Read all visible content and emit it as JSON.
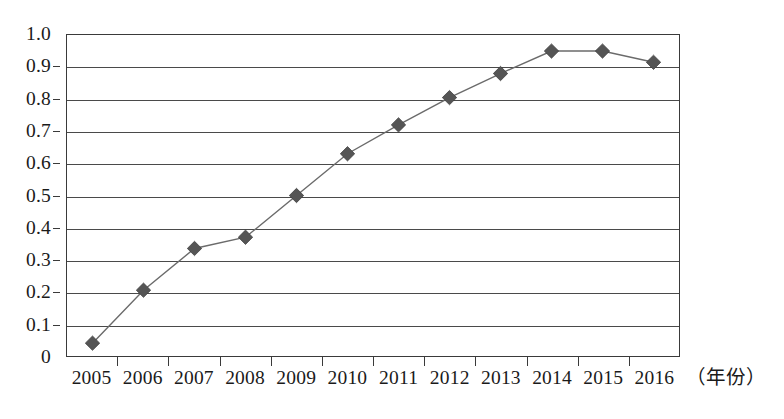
{
  "chart_data": {
    "type": "line",
    "title": "",
    "subtitle": "",
    "xlabel": "（年份）",
    "ylabel": "",
    "categories": [
      "2005",
      "2006",
      "2007",
      "2008",
      "2009",
      "2010",
      "2011",
      "2012",
      "2013",
      "2014",
      "2015",
      "2016"
    ],
    "values": [
      0.04,
      0.205,
      0.335,
      0.37,
      0.5,
      0.63,
      0.72,
      0.805,
      0.88,
      0.95,
      0.95,
      0.915
    ],
    "series": [
      {
        "name": "",
        "values": [
          0.04,
          0.205,
          0.335,
          0.37,
          0.5,
          0.63,
          0.72,
          0.805,
          0.88,
          0.95,
          0.95,
          0.915
        ]
      }
    ],
    "ylim": [
      0,
      1.0
    ],
    "y_ticks": [
      "0",
      "0.1",
      "0.2",
      "0.3",
      "0.4",
      "0.5",
      "0.6",
      "0.7",
      "0.8",
      "0.9",
      "1.0"
    ],
    "y_tick_values": [
      0,
      0.1,
      0.2,
      0.3,
      0.4,
      0.5,
      0.6,
      0.7,
      0.8,
      0.9,
      1.0
    ],
    "grid": "horizontal",
    "legend": "none",
    "marker": "diamond",
    "marker_color": "#555555",
    "line_color": "#6b6b6b",
    "axis_color": "#3a3a3a",
    "background_color": "#ffffff"
  }
}
